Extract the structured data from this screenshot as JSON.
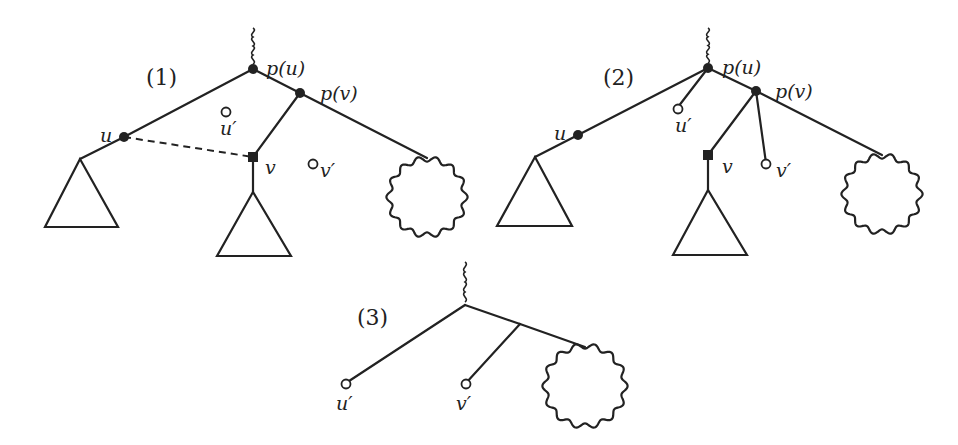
{
  "diagram": {
    "stroke_color": "#222222",
    "background": "#ffffff",
    "figures": [
      {
        "id": "fig1",
        "label": "(1)",
        "label_pos": [
          146,
          85
        ],
        "wiggles": [
          {
            "x": 253,
            "y1": 28,
            "y2": 64
          }
        ],
        "edges": [
          [
            253,
            69,
            124,
            137
          ],
          [
            124,
            137,
            80,
            159
          ],
          [
            253,
            69,
            300,
            93
          ],
          [
            300,
            93,
            427,
            158
          ],
          [
            300,
            93,
            253,
            157
          ],
          [
            253,
            157,
            253,
            192
          ]
        ],
        "dashed_edges": [
          [
            124,
            137,
            253,
            157
          ]
        ],
        "filled_nodes": [
          {
            "name": "p(u)",
            "x": 253,
            "y": 69
          },
          {
            "name": "p(v)",
            "x": 300,
            "y": 93
          },
          {
            "name": "u",
            "x": 124,
            "y": 137
          }
        ],
        "square_nodes": [
          {
            "name": "v",
            "x": 253,
            "y": 157
          }
        ],
        "hollow_nodes": [
          {
            "name": "u'",
            "x": 226,
            "y": 112
          },
          {
            "name": "v'",
            "x": 313,
            "y": 164
          }
        ],
        "triangles": [
          {
            "apex": [
              80,
              159
            ],
            "left": [
              45,
              227
            ],
            "right": [
              118,
              227
            ]
          },
          {
            "apex": [
              253,
              192
            ],
            "left": [
              217,
              256
            ],
            "right": [
              291,
              256
            ]
          }
        ],
        "blobs": [
          {
            "cx": 427,
            "cy": 197,
            "r": 38
          }
        ],
        "labels": [
          {
            "text": "p(u)",
            "x": 266,
            "y": 75
          },
          {
            "text": "p(v)",
            "x": 320,
            "y": 100
          },
          {
            "text": "u",
            "x": 100,
            "y": 142
          },
          {
            "text": "u′",
            "x": 220,
            "y": 135
          },
          {
            "text": "v",
            "x": 265,
            "y": 174
          },
          {
            "text": "v′",
            "x": 320,
            "y": 177
          }
        ]
      },
      {
        "id": "fig2",
        "label": "(2)",
        "label_pos": [
          603,
          85
        ],
        "wiggles": [
          {
            "x": 708,
            "y1": 28,
            "y2": 63
          }
        ],
        "edges": [
          [
            708,
            68,
            578,
            135
          ],
          [
            578,
            135,
            535,
            157
          ],
          [
            708,
            68,
            678,
            107
          ],
          [
            708,
            68,
            756,
            91
          ],
          [
            756,
            91,
            882,
            155
          ],
          [
            756,
            91,
            708,
            155
          ],
          [
            708,
            155,
            708,
            190
          ],
          [
            756,
            91,
            766,
            163
          ]
        ],
        "dashed_edges": [],
        "filled_nodes": [
          {
            "name": "p(u)",
            "x": 708,
            "y": 68
          },
          {
            "name": "p(v)",
            "x": 756,
            "y": 91
          },
          {
            "name": "u",
            "x": 578,
            "y": 135
          }
        ],
        "square_nodes": [
          {
            "name": "v",
            "x": 708,
            "y": 155
          }
        ],
        "hollow_nodes": [
          {
            "name": "u'",
            "x": 678,
            "y": 109
          },
          {
            "name": "v'",
            "x": 766,
            "y": 164
          }
        ],
        "triangles": [
          {
            "apex": [
              535,
              157
            ],
            "left": [
              497,
              226
            ],
            "right": [
              572,
              226
            ]
          },
          {
            "apex": [
              708,
              190
            ],
            "left": [
              673,
              255
            ],
            "right": [
              747,
              255
            ]
          }
        ],
        "blobs": [
          {
            "cx": 882,
            "cy": 194,
            "r": 38
          }
        ],
        "labels": [
          {
            "text": "p(u)",
            "x": 722,
            "y": 74
          },
          {
            "text": "p(v)",
            "x": 775,
            "y": 98
          },
          {
            "text": "u",
            "x": 554,
            "y": 140
          },
          {
            "text": "u′",
            "x": 675,
            "y": 132
          },
          {
            "text": "v",
            "x": 722,
            "y": 173
          },
          {
            "text": "v′",
            "x": 776,
            "y": 177
          }
        ]
      },
      {
        "id": "fig3",
        "label": "(3)",
        "label_pos": [
          357,
          325
        ],
        "wiggles": [
          {
            "x": 465,
            "y1": 262,
            "y2": 302
          }
        ],
        "edges": [
          [
            465,
            305,
            346,
            383
          ],
          [
            465,
            305,
            520,
            324
          ],
          [
            520,
            324,
            585,
            347
          ],
          [
            520,
            324,
            466,
            383
          ]
        ],
        "dashed_edges": [],
        "filled_nodes": [],
        "square_nodes": [],
        "hollow_nodes": [
          {
            "name": "u'",
            "x": 346,
            "y": 384
          },
          {
            "name": "v'",
            "x": 466,
            "y": 384
          }
        ],
        "triangles": [],
        "blobs": [
          {
            "cx": 585,
            "cy": 386,
            "r": 40
          }
        ],
        "labels": [
          {
            "text": "u′",
            "x": 336,
            "y": 410
          },
          {
            "text": "v′",
            "x": 456,
            "y": 410
          }
        ]
      }
    ]
  }
}
